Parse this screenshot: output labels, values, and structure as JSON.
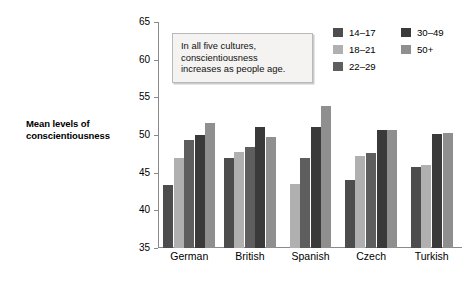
{
  "chart_data": {
    "type": "bar",
    "title": "",
    "xlabel": "",
    "ylabel": "Mean levels of conscientiousness",
    "ylim": [
      35,
      65
    ],
    "yticks": [
      35,
      40,
      45,
      50,
      55,
      60,
      65
    ],
    "grid": false,
    "legend_position": "top-right",
    "categories": [
      "German",
      "British",
      "Spanish",
      "Czech",
      "Turkish"
    ],
    "series": [
      {
        "name": "14–17",
        "color": "#4d4d4d",
        "values": [
          43.3,
          47.0,
          null,
          44.0,
          45.7
        ]
      },
      {
        "name": "18–21",
        "color": "#b0b0b0",
        "values": [
          46.9,
          47.8,
          43.5,
          47.2,
          46.0
        ]
      },
      {
        "name": "22–29",
        "color": "#5e5e5e",
        "values": [
          49.3,
          48.4,
          47.0,
          47.6,
          null
        ]
      },
      {
        "name": "30–49",
        "color": "#3a3a3a",
        "values": [
          50.0,
          51.0,
          51.0,
          50.7,
          50.1
        ]
      },
      {
        "name": "50+",
        "color": "#8f8f8f",
        "values": [
          51.6,
          49.7,
          53.8,
          50.7,
          50.3
        ]
      }
    ],
    "annotation": "In all five cultures, conscientiousness increases as people age."
  },
  "axis": {
    "y_title_line1": "Mean levels of",
    "y_title_line2": "conscientiousness",
    "tick_labels": [
      "65",
      "60",
      "55",
      "50",
      "45",
      "40",
      "35"
    ]
  },
  "annotation": {
    "line1": "In all five cultures,",
    "line2": "conscientiousness",
    "line3": "increases as people age."
  },
  "legend": {
    "column1": [
      {
        "label": "14–17",
        "color": "#4d4d4d"
      },
      {
        "label": "18–21",
        "color": "#b0b0b0"
      },
      {
        "label": "22–29",
        "color": "#5e5e5e"
      }
    ],
    "column2": [
      {
        "label": "30–49",
        "color": "#3a3a3a"
      },
      {
        "label": "50+",
        "color": "#8f8f8f"
      }
    ]
  },
  "colors": {
    "axis": "#8a8a8a",
    "text": "#000000",
    "annotation_bg": "#f4f3f1",
    "annotation_border": "#b9b9b9"
  }
}
